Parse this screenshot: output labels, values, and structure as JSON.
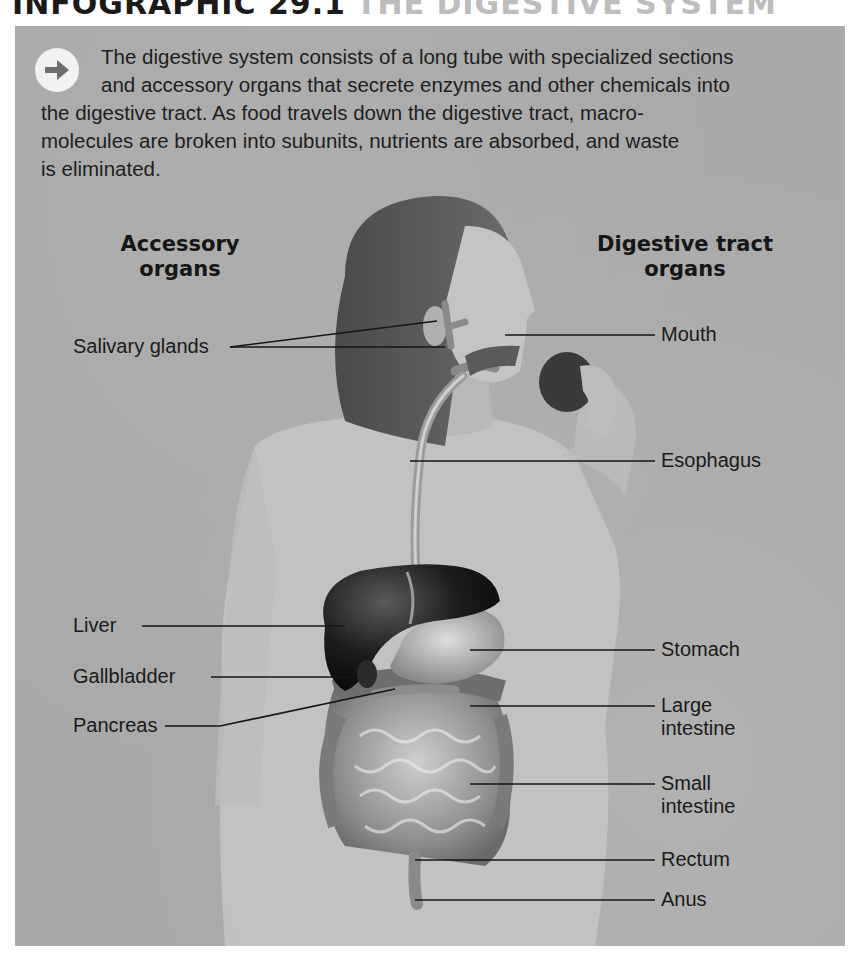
{
  "header": {
    "prefix": "INFOGRAPHIC 29.1",
    "title": "THE DIGESTIVE SYSTEM"
  },
  "intro": {
    "icon": "arrow-right-icon",
    "lines": [
      "The digestive system consists of a long tube with specialized sections",
      "and accessory organs that secrete enzymes and other chemicals into",
      "the digestive tract. As food travels down the digestive tract, macro-",
      "molecules are broken into subunits, nutrients are absorbed, and waste",
      "is eliminated."
    ]
  },
  "columns": {
    "left": {
      "line1": "Accessory",
      "line2": "organs"
    },
    "right": {
      "line1": "Digestive tract",
      "line2": "organs"
    }
  },
  "accessory_organs": [
    {
      "label": "Salivary glands"
    },
    {
      "label": "Liver"
    },
    {
      "label": "Gallbladder"
    },
    {
      "label": "Pancreas"
    }
  ],
  "digestive_tract_organs": [
    {
      "label": "Mouth"
    },
    {
      "label": "Esophagus"
    },
    {
      "label": "Stomach"
    },
    {
      "label": "Large",
      "label2": "intestine"
    },
    {
      "label": "Small",
      "label2": "intestine"
    },
    {
      "label": "Rectum"
    },
    {
      "label": "Anus"
    }
  ],
  "colors": {
    "panel_bg": "#a9a9a9",
    "text": "#1a1a1a",
    "organ_dark": "#1c1c1c",
    "shirt": "#c9c9c9"
  }
}
